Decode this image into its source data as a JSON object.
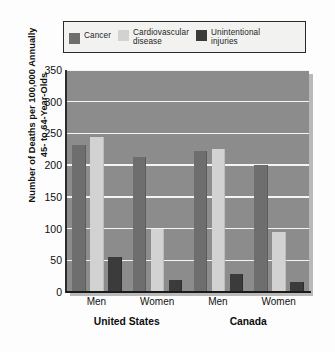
{
  "chart_data": {
    "type": "bar",
    "title": "",
    "xlabel": "",
    "ylabel": "Number of Deaths per 100,000 Annually\n45- to 64-Year-Olds",
    "ylim": [
      0,
      350
    ],
    "yticks": [
      0,
      50,
      100,
      150,
      200,
      250,
      300,
      350
    ],
    "grid": true,
    "legend_position": "top",
    "categories": [
      "Men",
      "Women",
      "Men",
      "Women"
    ],
    "groups": [
      {
        "name": "United States",
        "categories": [
          "Men",
          "Women"
        ]
      },
      {
        "name": "Canada",
        "categories": [
          "Men",
          "Women"
        ]
      }
    ],
    "series": [
      {
        "name": "Cancer",
        "color": "#6e6e6e",
        "values": [
          232,
          213,
          223,
          200
        ]
      },
      {
        "name": "Cardiovascular disease",
        "color": "#d2d2d2",
        "values": [
          245,
          100,
          226,
          95
        ]
      },
      {
        "name": "Unintentional injuries",
        "color": "#3b3b3b",
        "values": [
          55,
          19,
          29,
          16
        ]
      }
    ]
  },
  "legend": {
    "items": [
      {
        "label": "Cancer",
        "swatch": "legend-swatch-cancer"
      },
      {
        "label": "Cardiovascular\ndisease",
        "swatch": "legend-swatch-cardiovascular"
      },
      {
        "label": "Unintentional\ninjuries",
        "swatch": "legend-swatch-injuries"
      }
    ]
  },
  "axes": {
    "y_title": "Number of Deaths per 100,000 Annually\n45- to 64-Year-Olds",
    "y_tick_labels": [
      "350",
      "300",
      "250",
      "200",
      "150",
      "100",
      "50",
      "0"
    ],
    "x_tick_labels": [
      "Men",
      "Women",
      "Men",
      "Women"
    ],
    "x_group_labels": [
      "United States",
      "Canada"
    ]
  },
  "colors": {
    "plot_background": "#8c8c8c",
    "gridline": "#f4f4f4",
    "axis": "#1a1a1a",
    "legend_background": "#f2f2f0",
    "legend_border": "#2a2a2a",
    "page_background": "#fdfdfd"
  }
}
